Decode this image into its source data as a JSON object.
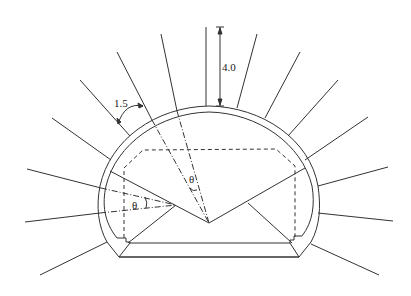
{
  "diagram": {
    "labels": {
      "bolt_length_dimension": "4.0",
      "bolt_spacing": "1.5",
      "angle_symbol_center": "θ",
      "angle_symbol_left": "θ"
    },
    "colors": {
      "line": "#333333",
      "background": "#ffffff"
    },
    "elements": {
      "outer_lining": "semicircular arch with straight lower walls",
      "inner_lining": "concentric inner arch",
      "clearance_profile": "dashed polygon",
      "invert": "flat base trapezoid",
      "rock_bolts_count": 15
    }
  }
}
